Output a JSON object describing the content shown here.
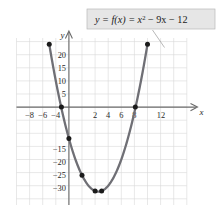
{
  "chart_data": {
    "type": "line",
    "title": "",
    "subtitle": "",
    "annotation": "y = f(x) = x² − 9x − 12",
    "annotation_parts": {
      "lead": "y = f(x) = x",
      "exponent": "2",
      "tail": " − 9x − 12"
    },
    "function": "f(x) = x^2 - 9x - 12",
    "xlabel": "x",
    "ylabel": "y",
    "xlim": [
      -9,
      14
    ],
    "ylim": [
      -36,
      27
    ],
    "grid": true,
    "grid_step_x": 2,
    "grid_step_y": 5,
    "legend_position": "top-right-callout",
    "x_ticks": [
      -8,
      -6,
      -4,
      2,
      4,
      6,
      8,
      12
    ],
    "x_tick_labels": [
      "−8",
      "−6",
      "−4",
      "2",
      "4",
      "6",
      "8",
      "12"
    ],
    "y_ticks": [
      20,
      15,
      10,
      5,
      -15,
      -20,
      -25,
      -30
    ],
    "y_tick_labels": [
      "20",
      "15",
      "10",
      "5",
      "−15",
      "−20",
      "−25",
      "−30"
    ],
    "series": [
      {
        "name": "f(x) = x² − 9x − 12",
        "color": "#6f6f75",
        "x": [
          -3,
          -2,
          -1,
          0,
          1,
          2,
          3,
          4,
          5,
          6,
          7,
          8,
          9,
          10,
          11,
          12
        ],
        "values": [
          24,
          10,
          -2,
          -12,
          -20,
          -26,
          -30,
          -32,
          -32,
          -30,
          -26,
          -20,
          -12,
          -2,
          10,
          24
        ]
      }
    ],
    "points": [
      {
        "x": -3,
        "y": 24
      },
      {
        "x": -1.14,
        "y": 0
      },
      {
        "x": 0,
        "y": -12
      },
      {
        "x": 2,
        "y": -26
      },
      {
        "x": 4,
        "y": -32
      },
      {
        "x": 5,
        "y": -32
      },
      {
        "x": 10.14,
        "y": 0
      },
      {
        "x": 12,
        "y": 24
      }
    ]
  }
}
